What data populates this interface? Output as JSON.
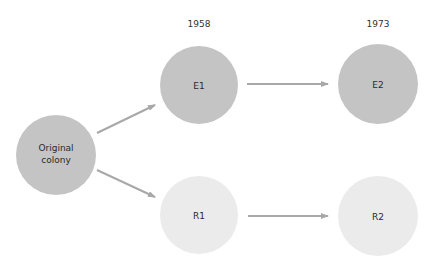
{
  "diagram": {
    "years": [
      {
        "label": "1958",
        "x": 199,
        "y": 24
      },
      {
        "label": "1973",
        "x": 378,
        "y": 24
      }
    ],
    "colors": {
      "dark_node": "#c4c4c4",
      "light_node": "#ebebeb",
      "arrow": "#a8a8a8",
      "text": "#2a2a2a"
    },
    "nodes": [
      {
        "id": "original",
        "line1": "Original",
        "line2": "colony",
        "cx": 56,
        "cy": 155,
        "r": 40,
        "shade": "dark"
      },
      {
        "id": "E1",
        "label": "E1",
        "cx": 199,
        "cy": 85,
        "r": 39,
        "shade": "dark"
      },
      {
        "id": "E2",
        "label": "E2",
        "cx": 378,
        "cy": 84,
        "r": 40,
        "shade": "dark"
      },
      {
        "id": "R1",
        "label": "R1",
        "cx": 199,
        "cy": 215,
        "r": 39,
        "shade": "light"
      },
      {
        "id": "R2",
        "label": "R2",
        "cx": 378,
        "cy": 216,
        "r": 40,
        "shade": "light"
      }
    ],
    "edges": [
      {
        "from": "original",
        "to": "E1"
      },
      {
        "from": "original",
        "to": "R1"
      },
      {
        "from": "E1",
        "to": "E2"
      },
      {
        "from": "R1",
        "to": "R2"
      }
    ]
  }
}
